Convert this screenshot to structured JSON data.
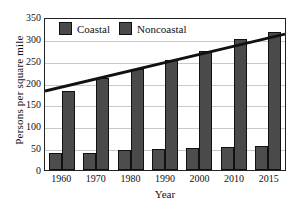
{
  "chart_data": {
    "type": "bar",
    "title": "",
    "xlabel": "Year",
    "ylabel": "Persons per square mile",
    "categories": [
      "1960",
      "1970",
      "1980",
      "1990",
      "2000",
      "2010",
      "2015"
    ],
    "series": [
      {
        "name": "Coastal",
        "values": [
          38,
          40,
          45,
          47,
          50,
          53,
          55
        ]
      },
      {
        "name": "Noncoastal",
        "values": [
          180,
          210,
          230,
          252,
          272,
          300,
          315
        ]
      }
    ],
    "trend_line": {
      "name": "trend",
      "start_value": 183,
      "end_value": 315,
      "color": "#111111"
    },
    "ylim": [
      0,
      350
    ],
    "yticks": [
      "0",
      "50",
      "100",
      "150",
      "200",
      "250",
      "300",
      "350"
    ],
    "ytick_values": [
      0,
      50,
      100,
      150,
      200,
      250,
      300,
      350
    ],
    "grid": true,
    "legend_position": "top-left",
    "legend": [
      "Coastal",
      "Noncoastal"
    ],
    "colors": {
      "coastal": "#4d4d4d",
      "noncoastal": "#4a4a4a",
      "axis": "#222222",
      "grid": "#c9c9c9"
    }
  }
}
